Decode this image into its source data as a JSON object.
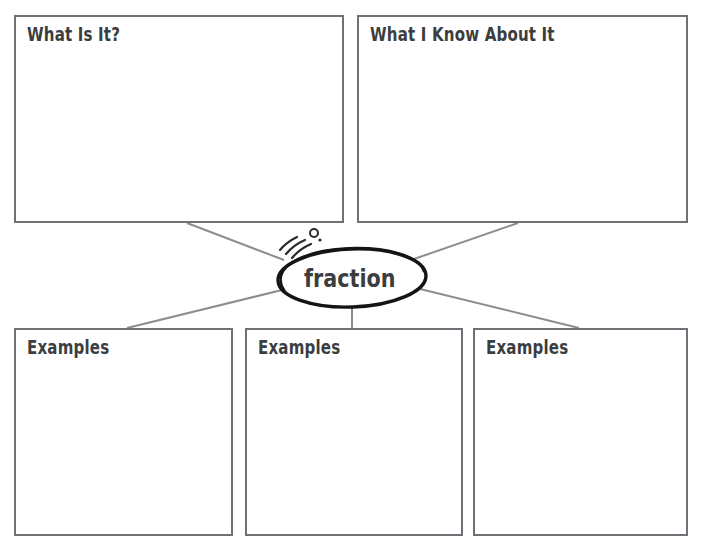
{
  "worksheet": {
    "type": "graphic-organizer",
    "center": {
      "term": "fraction",
      "shape": "oval",
      "decoration": "sparkle-marks"
    },
    "top_boxes": [
      {
        "label": "What Is It?",
        "content": ""
      },
      {
        "label": "What I Know About It",
        "content": ""
      }
    ],
    "bottom_boxes": [
      {
        "label": "Examples",
        "content": ""
      },
      {
        "label": "Examples",
        "content": ""
      },
      {
        "label": "Examples",
        "content": ""
      }
    ],
    "colors": {
      "box_border": "#6e7175",
      "connector_line": "#8a8d91",
      "text": "#3b3d40",
      "oval_outline": "#1a1a1a",
      "background": "#ffffff"
    }
  }
}
